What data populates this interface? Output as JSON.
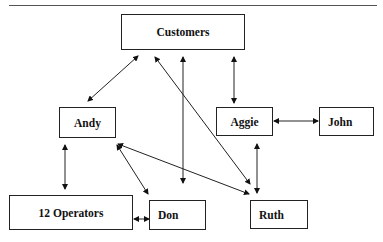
{
  "diagram": {
    "type": "organizational-relationship-diagram",
    "nodes": [
      {
        "id": "customers",
        "label": "Customers"
      },
      {
        "id": "andy",
        "label": "Andy"
      },
      {
        "id": "aggie",
        "label": "Aggie"
      },
      {
        "id": "john",
        "label": "John"
      },
      {
        "id": "operators",
        "label": "12 Operators"
      },
      {
        "id": "don",
        "label": "Don"
      },
      {
        "id": "ruth",
        "label": "Ruth"
      }
    ],
    "edges": [
      {
        "from": "customers",
        "to": "andy",
        "direction": "both"
      },
      {
        "from": "customers",
        "to": "ruth",
        "direction": "both"
      },
      {
        "from": "customers",
        "to": "don",
        "direction": "both"
      },
      {
        "from": "customers",
        "to": "aggie",
        "direction": "both"
      },
      {
        "from": "aggie",
        "to": "john",
        "direction": "both"
      },
      {
        "from": "andy",
        "to": "operators",
        "direction": "both"
      },
      {
        "from": "andy",
        "to": "don",
        "direction": "both"
      },
      {
        "from": "andy",
        "to": "ruth",
        "direction": "both"
      },
      {
        "from": "aggie",
        "to": "ruth",
        "direction": "both"
      },
      {
        "from": "operators",
        "to": "don",
        "direction": "both"
      }
    ]
  }
}
